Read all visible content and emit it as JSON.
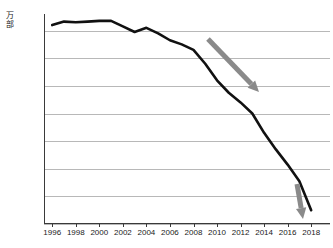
{
  "chart_data": {
    "type": "line",
    "title": "",
    "xlabel": "",
    "ylabel": "万部",
    "x": [
      1996,
      1997,
      1998,
      1999,
      2000,
      2001,
      2002,
      2003,
      2004,
      2005,
      2006,
      2007,
      2008,
      2009,
      2010,
      2011,
      2012,
      2013,
      2014,
      2015,
      2016,
      2017,
      2018
    ],
    "values": [
      5340,
      5365,
      5360,
      5365,
      5370,
      5370,
      5330,
      5290,
      5320,
      5280,
      5230,
      5200,
      5160,
      5060,
      4940,
      4850,
      4780,
      4700,
      4560,
      4440,
      4330,
      4210,
      4000
    ],
    "series": [
      {
        "name": "発行部数",
        "values": [
          5340,
          5365,
          5360,
          5365,
          5370,
          5370,
          5330,
          5290,
          5320,
          5280,
          5230,
          5200,
          5160,
          5060,
          4940,
          4850,
          4780,
          4700,
          4560,
          4440,
          4330,
          4210,
          4000
        ]
      }
    ],
    "xtick_labels": [
      "1996",
      "1998",
      "2000",
      "2002",
      "2004",
      "2006",
      "2008",
      "2010",
      "2012",
      "2014",
      "2016",
      "2018"
    ],
    "xtick_values": [
      1996,
      1998,
      2000,
      2002,
      2004,
      2006,
      2008,
      2010,
      2012,
      2014,
      2016,
      2018
    ],
    "ytick_labels": [
      "3900",
      "4100",
      "4300",
      "4500",
      "4700",
      "4900",
      "5100",
      "5300"
    ],
    "ytick_values": [
      3900,
      4100,
      4300,
      4500,
      4700,
      4900,
      5100,
      5300
    ],
    "ylim": [
      3900,
      5420
    ],
    "xlim": [
      1995.3,
      2019.6
    ],
    "grid": "horizontal",
    "legend": "none",
    "line_color": "#111111",
    "grid_color": "#b8b8b8",
    "axis_color": "#3a3a3a",
    "annotations": [
      {
        "name": "decline-arrow-mid",
        "type": "arrow",
        "color": "#8a8a8a",
        "x1": 208,
        "y1": 39,
        "x2": 259,
        "y2": 92
      },
      {
        "name": "decline-arrow-end",
        "type": "arrow",
        "color": "#8a8a8a",
        "x1": 297,
        "y1": 184,
        "x2": 303,
        "y2": 219
      }
    ]
  },
  "axis": {
    "y_unit_label": "万部"
  },
  "title_strip": {
    "text": ""
  }
}
